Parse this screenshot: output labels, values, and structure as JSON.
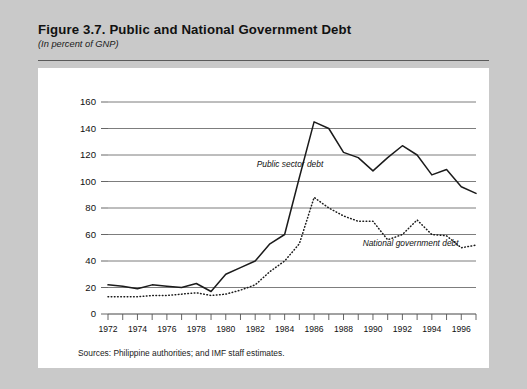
{
  "figure": {
    "title": "Figure 3.7.  Public and National Government Debt",
    "subtitle": "(In percent of GNP)",
    "source_note": "Sources:  Philippine authorities; and IMF staff estimates."
  },
  "chart_data": {
    "type": "line",
    "title": "Figure 3.7.  Public and National Government Debt",
    "subtitle": "(In percent of GNP)",
    "xlabel": "",
    "ylabel": "",
    "ylim": [
      0,
      160
    ],
    "xlim": [
      1972,
      1997
    ],
    "ytick_values": [
      0,
      20,
      40,
      60,
      80,
      100,
      120,
      140,
      160
    ],
    "ytick_labels": [
      "0",
      "20",
      "40",
      "60",
      "80",
      "100",
      "120",
      "140",
      "160"
    ],
    "xtick_values": [
      1972,
      1973,
      1974,
      1975,
      1976,
      1977,
      1978,
      1979,
      1980,
      1981,
      1982,
      1983,
      1984,
      1985,
      1986,
      1987,
      1988,
      1989,
      1990,
      1991,
      1992,
      1993,
      1994,
      1995,
      1996,
      1997
    ],
    "xtick_labels": [
      "1972",
      "",
      "1974",
      "",
      "1976",
      "",
      "1978",
      "",
      "1980",
      "",
      "1982",
      "",
      "1984",
      "",
      "1986",
      "",
      "1988",
      "",
      "1990",
      "",
      "1992",
      "",
      "1994",
      "",
      "1996",
      ""
    ],
    "grid": "horizontal",
    "legend_position": "inline-annotation",
    "x": [
      1972,
      1973,
      1974,
      1975,
      1976,
      1977,
      1978,
      1979,
      1980,
      1981,
      1982,
      1983,
      1984,
      1985,
      1986,
      1987,
      1988,
      1989,
      1990,
      1991,
      1992,
      1993,
      1994,
      1995,
      1996,
      1997
    ],
    "series": [
      {
        "name": "Public sector debt",
        "style": "solid",
        "color": "#1b1b1b",
        "values": [
          22,
          21,
          19,
          22,
          21,
          20,
          23,
          17,
          30,
          35,
          40,
          53,
          60,
          103,
          145,
          140,
          122,
          118,
          108,
          118,
          127,
          120,
          105,
          109,
          96,
          91
        ]
      },
      {
        "name": "National government debt",
        "style": "dotted",
        "color": "#1b1b1b",
        "values": [
          13,
          13,
          13,
          14,
          14,
          15,
          16,
          14,
          15,
          18,
          22,
          32,
          40,
          53,
          88,
          80,
          74,
          70,
          70,
          56,
          60,
          71,
          60,
          59,
          50,
          52
        ]
      }
    ],
    "annotations": [
      {
        "text": "Public sector debt",
        "x": 1982.1,
        "y": 111
      },
      {
        "text": "National government debt",
        "x": 1989.3,
        "y": 51
      }
    ]
  }
}
